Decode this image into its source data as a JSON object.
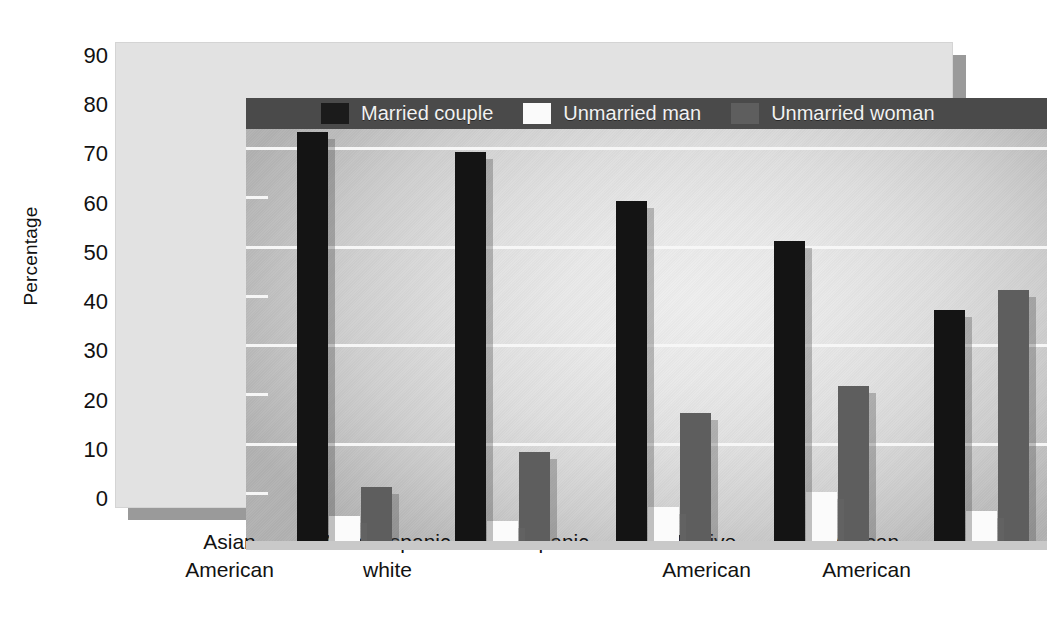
{
  "chart_data": {
    "type": "bar",
    "title": "",
    "xlabel": "",
    "ylabel": "Percentage",
    "ylim": [
      0,
      90
    ],
    "yticks": [
      0,
      10,
      20,
      30,
      40,
      50,
      60,
      70,
      80,
      90
    ],
    "ytick_labels": [
      "0",
      "10",
      "20",
      "30",
      "40",
      "50",
      "60",
      "70",
      "80",
      "90"
    ],
    "major_gridlines": [
      20,
      40,
      60,
      80
    ],
    "minor_ticks": [
      10,
      30,
      50,
      70
    ],
    "grid": true,
    "legend_position": "top-inside",
    "categories": [
      "Asian\nAmerican",
      "Non-Hispanic\nwhite",
      "Hispanic",
      "Native\nAmerican",
      "African\nAmerican"
    ],
    "category_lines": [
      [
        "Asian",
        "American"
      ],
      [
        "Non-Hispanic",
        "white"
      ],
      [
        "Hispanic",
        ""
      ],
      [
        "Native",
        "American"
      ],
      [
        "African",
        "American"
      ]
    ],
    "series": [
      {
        "name": "Married couple",
        "color": "#141414",
        "values": [
          83,
          79,
          69,
          61,
          47
        ]
      },
      {
        "name": "Unmarried man",
        "color": "#fbfbfb",
        "values": [
          5,
          4,
          7,
          10,
          6
        ]
      },
      {
        "name": "Unmarried woman",
        "color": "#5e5e5e",
        "values": [
          11,
          18,
          26,
          31.5,
          51
        ]
      }
    ]
  },
  "legend": {
    "items": [
      {
        "label": "Married couple",
        "swatch": "married"
      },
      {
        "label": "Unmarried man",
        "swatch": "man"
      },
      {
        "label": "Unmarried woman",
        "swatch": "woman"
      }
    ]
  },
  "axis": {
    "y_title": "Percentage"
  },
  "colors": {
    "married": "#141414",
    "unmarried_man": "#fbfbfb",
    "unmarried_woman": "#5e5e5e",
    "legend_band": "#4a4a4a",
    "gridline": "#f6f6f6",
    "frame": "#e2e2e2"
  }
}
